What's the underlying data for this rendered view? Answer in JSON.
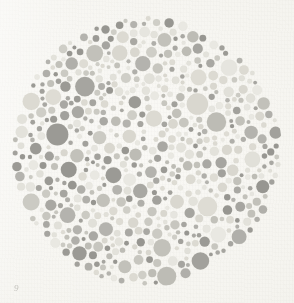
{
  "document": {
    "title": "Ishihara Pseudoisochromatic Plate",
    "media": "printed-plate-scan",
    "canvas": {
      "width": 294,
      "height": 303
    }
  },
  "paper": {
    "background_color": "#f5f4ef",
    "highlight_color": "#faf9f6",
    "shadow_color": "#eceae3"
  },
  "annotation": {
    "mark_text": "9",
    "x": 14,
    "y": 283,
    "visible": true
  },
  "plate": {
    "name": "dot-mosaic-disc",
    "center_x": 146,
    "center_y": 151,
    "radius": 134,
    "edge_roughness": 4.5,
    "dot_count": 1020,
    "dot_radius_min": 1.9,
    "dot_radius_max": 11.2,
    "dot_gap": 0.72,
    "packing_attempts": 26000,
    "seed": 20240517,
    "outline_opacity": 0.16,
    "palettes": {
      "light": {
        "name": "light-dots",
        "weight": 0.5,
        "colors": [
          "#e9e8e2",
          "#e3e2db",
          "#dedcd4",
          "#d9d7cf",
          "#e6e5df",
          "#dcdad2",
          "#e1e0d9"
        ]
      },
      "mid": {
        "name": "mid-dots",
        "weight": 0.22,
        "colors": [
          "#cfcec7",
          "#c7c6bf",
          "#c2c1ba",
          "#cbcac3",
          "#bdbcb5"
        ]
      },
      "dark": {
        "name": "dark-dots",
        "weight": 0.28,
        "colors": [
          "#a9a8a3",
          "#a2a19c",
          "#9b9a95",
          "#b0afaa",
          "#979691",
          "#a6a5a0",
          "#b4b3ae"
        ]
      }
    },
    "figure": {
      "name": "hidden-numeral",
      "description": "Numeral traced by the lighter dot family against the darker surround",
      "glyph": "5",
      "stroke_width": 19,
      "visible_to_normal_vision": true,
      "strokes": [
        {
          "type": "line",
          "x1": 118,
          "y1": 86,
          "x2": 176,
          "y2": 86
        },
        {
          "type": "line",
          "x1": 118,
          "y1": 86,
          "x2": 113,
          "y2": 140
        },
        {
          "type": "line",
          "x1": 113,
          "y1": 140,
          "x2": 150,
          "y2": 136
        },
        {
          "type": "arc",
          "cx": 152,
          "cy": 176,
          "r": 41,
          "a1": -82,
          "a2": 118
        },
        {
          "type": "line",
          "x1": 150,
          "y1": 217,
          "x2": 118,
          "y2": 210
        }
      ]
    }
  }
}
